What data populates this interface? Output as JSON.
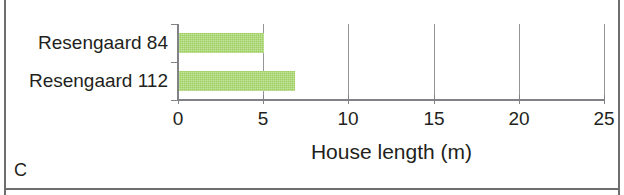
{
  "panel": {
    "letter": "C"
  },
  "colors": {
    "bar": "#9ed05f",
    "axis": "#808285",
    "grid": "#939598",
    "text": "#231f20",
    "frame": "#6d6e70",
    "background": "#ffffff"
  },
  "chart_data": {
    "type": "bar",
    "orientation": "horizontal",
    "title": "",
    "xlabel": "House length (m)",
    "ylabel": "",
    "categories": [
      "Resengaard 84",
      "Resengaard 112"
    ],
    "values": [
      5.0,
      6.8
    ],
    "xlim": [
      0,
      25
    ],
    "xticks": [
      0,
      5,
      10,
      15,
      20,
      25
    ],
    "xticklabels": [
      "0",
      "5",
      "10",
      "15",
      "20",
      "25"
    ],
    "grid": true,
    "grid_axis": "x",
    "legend": false,
    "annotations": [
      "C"
    ]
  }
}
